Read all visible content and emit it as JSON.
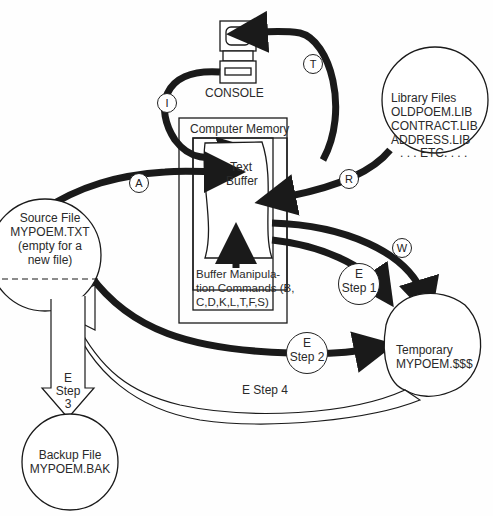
{
  "diagram": {
    "console": {
      "label": "CONSOLE"
    },
    "library": {
      "title": "Library Files",
      "files": [
        "OLDPOEM.LIB",
        "CONTRACT.LIB",
        "ADDRESS.LIB",
        ". . . ETC. . . ."
      ]
    },
    "memory": {
      "title": "Computer Memory",
      "buffer_line1": "Text",
      "buffer_line2": "Buffer",
      "commands_line1": "Buffer Manipula-",
      "commands_line2": "tion Commands (B,",
      "commands_line3": "C,D,K,L,T,F,S)"
    },
    "source": {
      "line1": "Source File",
      "line2": "MYPOEM.TXT",
      "line3": "(empty for a",
      "line4": "new file)"
    },
    "temporary": {
      "line1": "Temporary",
      "line2": "MYPOEM.$$$"
    },
    "backup": {
      "line1": "Backup File",
      "line2": "MYPOEM.BAK"
    },
    "badges": {
      "t": "T",
      "i": "I",
      "a": "A",
      "r": "R",
      "w": "W"
    },
    "steps": {
      "step1_e": "E",
      "step1_label": "Step 1",
      "step2_e": "E",
      "step2_label": "Step 2",
      "step3_e": "E",
      "step3_label": "Step",
      "step3_num": "3",
      "step4_label": "E Step 4"
    },
    "colors": {
      "ink": "#1a1a1a",
      "paper": "#fefefe",
      "text": "#2a2a2a"
    }
  }
}
